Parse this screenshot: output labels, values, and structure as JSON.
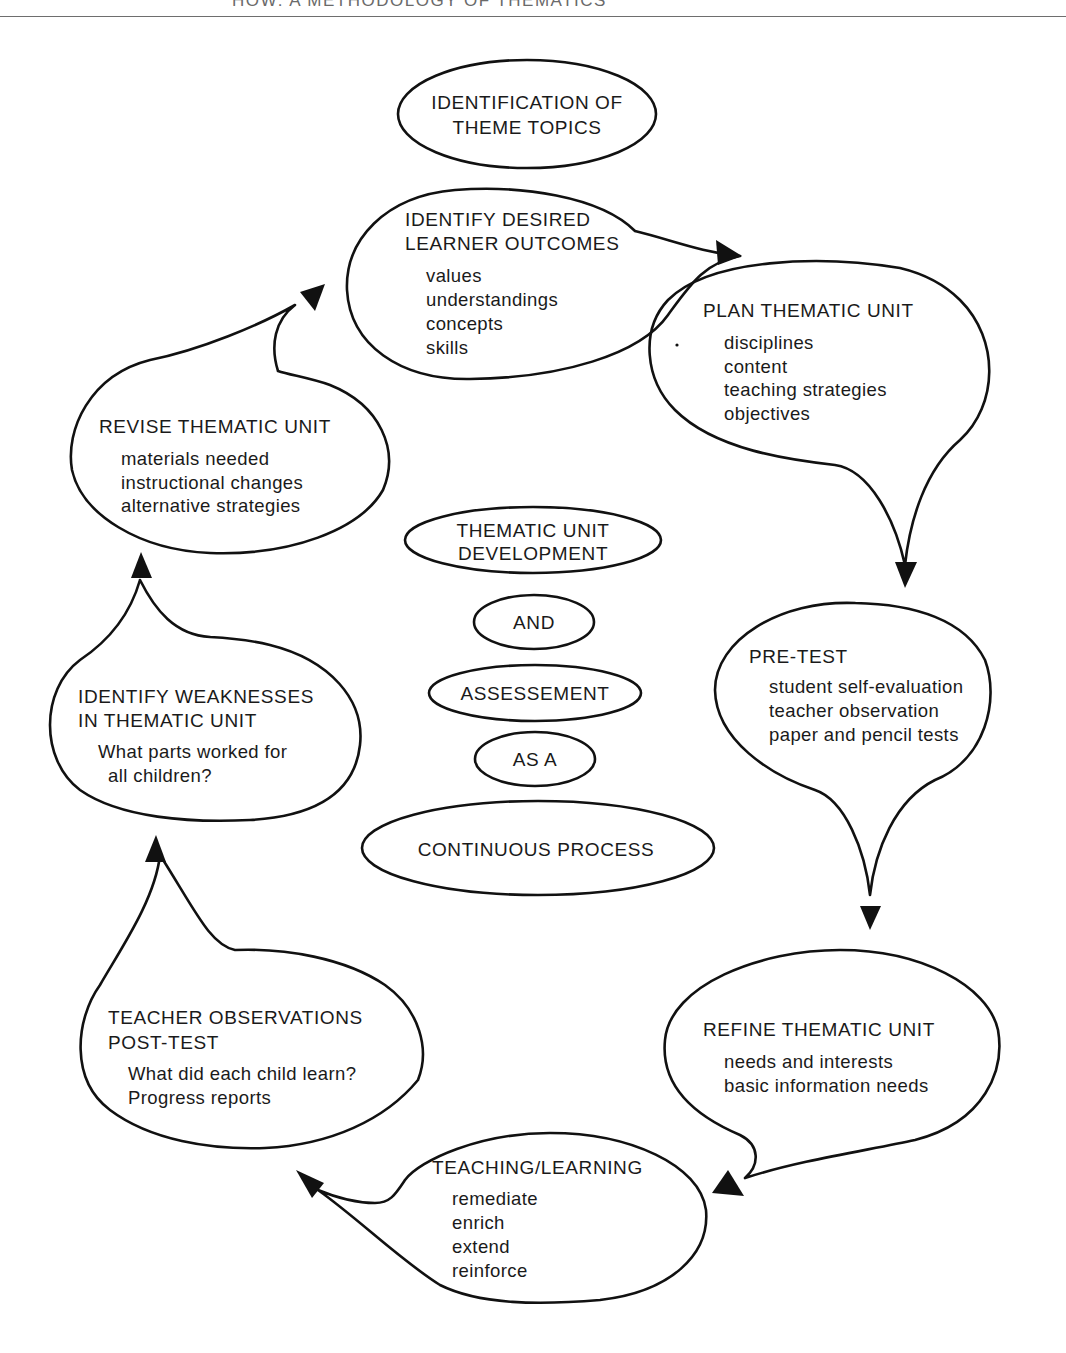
{
  "page_header": "HOW: A METHODOLOGY OF THEMATICS",
  "colors": {
    "ink": "#111111",
    "background": "#ffffff",
    "header_text": "#6a6a6a"
  },
  "center_title": {
    "line1": "THEMATIC UNIT",
    "line2": "DEVELOPMENT",
    "word_and": "AND",
    "word_assessment": "ASSESSEMENT",
    "word_as_a": "AS A",
    "word_process": "CONTINUOUS PROCESS"
  },
  "start_node": {
    "line1": "IDENTIFICATION OF",
    "line2": "THEME TOPICS"
  },
  "nodes": [
    {
      "id": "outcomes",
      "title": [
        "IDENTIFY DESIRED",
        "LEARNER OUTCOMES"
      ],
      "items": [
        "values",
        "understandings",
        "concepts",
        "skills"
      ]
    },
    {
      "id": "plan",
      "title": [
        "PLAN THEMATIC UNIT"
      ],
      "items": [
        "disciplines",
        "content",
        "teaching strategies",
        "objectives"
      ]
    },
    {
      "id": "pretest",
      "title": [
        "PRE-TEST"
      ],
      "items": [
        "student self-evaluation",
        "teacher observation",
        "paper and pencil tests"
      ]
    },
    {
      "id": "refine",
      "title": [
        "REFINE THEMATIC UNIT"
      ],
      "items": [
        "needs and interests",
        "basic information needs"
      ]
    },
    {
      "id": "teaching",
      "title": [
        "TEACHING/LEARNING"
      ],
      "items": [
        "remediate",
        "enrich",
        "extend",
        "reinforce"
      ]
    },
    {
      "id": "posttest",
      "title": [
        "TEACHER OBSERVATIONS",
        "POST-TEST"
      ],
      "items": [
        "What did each child learn?",
        "Progress reports"
      ]
    },
    {
      "id": "weaknesses",
      "title": [
        "IDENTIFY WEAKNESSES",
        "IN THEMATIC UNIT"
      ],
      "items": [
        "What parts worked for",
        "all children?"
      ]
    },
    {
      "id": "revise",
      "title": [
        "REVISE THEMATIC UNIT"
      ],
      "items": [
        "materials needed",
        "instructional changes",
        "alternative strategies"
      ]
    }
  ],
  "flow": [
    "outcomes -> plan",
    "plan -> pretest",
    "pretest -> refine",
    "refine -> teaching",
    "teaching -> posttest",
    "posttest -> weaknesses",
    "weaknesses -> revise",
    "revise -> outcomes"
  ]
}
